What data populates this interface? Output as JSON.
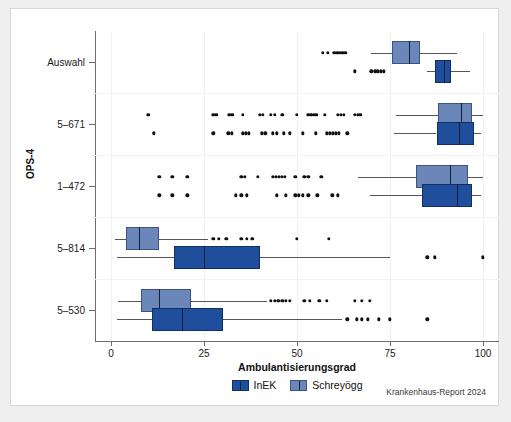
{
  "chart_data": {
    "type": "box",
    "title": "",
    "xlabel": "Ambulantisierungsgrad",
    "ylabel": "OPS-4",
    "xlim": [
      0,
      100
    ],
    "xticks": [
      0,
      25,
      50,
      75,
      100
    ],
    "xticklabels": [
      "0",
      "25",
      "50",
      "75",
      "100"
    ],
    "categories": [
      "Auswahl",
      "5–671",
      "1–472",
      "5–814",
      "5–530"
    ],
    "grid": "vertical",
    "legend": {
      "position": "bottom",
      "entries": [
        {
          "name": "InEK",
          "color": "#1f4e9c"
        },
        {
          "name": "Schreyögg",
          "color": "#6b86b9"
        }
      ]
    },
    "series": [
      {
        "name": "Schreyögg",
        "color": "#6b86b9",
        "boxes": [
          {
            "category": "Auswahl",
            "whisker_low": 70.0,
            "q1": 75.5,
            "median": 80.0,
            "q3": 83.0,
            "whisker_high": 93.0,
            "outliers": [
              57.0,
              58.3,
              60.0,
              60.8,
              61.5,
              62.2,
              63.0
            ]
          },
          {
            "category": "5–671",
            "whisker_low": 76.5,
            "q1": 88.0,
            "median": 94.0,
            "q3": 97.0,
            "whisker_high": 100.0,
            "outliers": [
              10.0,
              27.5,
              28.3,
              31.8,
              32.6,
              35.5,
              40.0,
              40.8,
              43.0,
              44.0,
              46.0,
              50.0,
              53.0,
              53.8,
              54.5,
              55.2,
              57.5,
              61.0,
              61.8,
              62.6,
              65.5,
              66.3,
              67.0
            ]
          },
          {
            "category": "1–472",
            "whisker_low": 66.5,
            "q1": 82.0,
            "median": 91.0,
            "q3": 96.0,
            "whisker_high": 100.0,
            "outliers": [
              13.0,
              16.5,
              20.5,
              35.0,
              36.0,
              39.5,
              43.5,
              44.3,
              45.1,
              45.9,
              46.7,
              49.5,
              52.0,
              53.0,
              56.5
            ]
          },
          {
            "category": "5–814",
            "whisker_low": 1.0,
            "q1": 4.0,
            "median": 7.5,
            "q3": 13.0,
            "whisker_high": 26.0,
            "outliers": [
              27.5,
              29.0,
              31.0,
              35.0,
              36.5,
              38.0,
              50.0,
              58.5
            ]
          },
          {
            "category": "5–530",
            "whisker_low": 2.0,
            "q1": 8.0,
            "median": 13.0,
            "q3": 21.5,
            "whisker_high": 42.0,
            "outliers": [
              43.0,
              44.0,
              45.0,
              46.0,
              47.0,
              48.0,
              52.0,
              53.5,
              56.0,
              58.0,
              65.5,
              67.5,
              69.5
            ]
          }
        ]
      },
      {
        "name": "InEK",
        "color": "#1f4e9c",
        "boxes": [
          {
            "category": "Auswahl",
            "whisker_low": 85.0,
            "q1": 87.0,
            "median": 89.5,
            "q3": 91.5,
            "whisker_high": 96.5,
            "outliers": [
              65.5,
              70.0,
              71.0,
              71.8,
              72.6,
              73.4
            ]
          },
          {
            "category": "5–671",
            "whisker_low": 76.0,
            "q1": 87.5,
            "median": 93.5,
            "q3": 97.5,
            "whisker_high": 99.5,
            "outliers": [
              11.5,
              27.5,
              31.5,
              32.5,
              35.5,
              36.3,
              37.1,
              40.5,
              41.5,
              43.5,
              44.5,
              46.5,
              48.0,
              51.5,
              55.0,
              58.0,
              58.8,
              59.6,
              60.4,
              61.2,
              63.5
            ]
          },
          {
            "category": "1–472",
            "whisker_low": 69.5,
            "q1": 83.5,
            "median": 93.0,
            "q3": 97.0,
            "whisker_high": 99.5,
            "outliers": [
              13.0,
              16.5,
              20.5,
              33.5,
              35.0,
              36.5,
              44.5,
              47.0,
              49.5,
              50.5,
              51.5,
              53.0,
              55.5,
              59.5,
              61.0
            ]
          },
          {
            "category": "5–814",
            "whisker_low": 1.5,
            "q1": 17.0,
            "median": 25.0,
            "q3": 40.0,
            "whisker_high": 75.0,
            "outliers": [
              85.0,
              87.0,
              100.0
            ]
          },
          {
            "category": "5–530",
            "whisker_low": 1.5,
            "q1": 11.0,
            "median": 19.0,
            "q3": 30.0,
            "whisker_high": 62.0,
            "outliers": [
              63.5,
              66.0,
              67.5,
              69.0,
              72.0,
              75.0,
              85.0
            ]
          }
        ]
      }
    ]
  },
  "credit": "Krankenhaus-Report 2024"
}
